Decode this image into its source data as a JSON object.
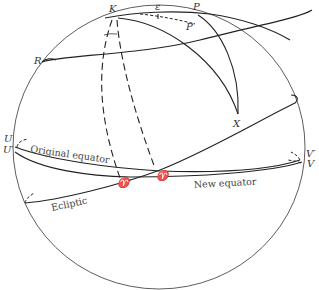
{
  "diagram": {
    "type": "celestial-sphere-precession",
    "points": {
      "K": "K",
      "P": "P",
      "P_prime": "P′",
      "epsilon": "ε",
      "R": "R",
      "X": "X",
      "U": "U",
      "U_prime": "U′",
      "V": "V",
      "V_prime": "V′",
      "vernal": "♈",
      "vernal_prime": "♈′"
    },
    "labels": {
      "original_equator": "Original equator",
      "new_equator": "New equator",
      "ecliptic": "Ecliptic"
    },
    "colors": {
      "stroke": "#222222",
      "background": "#ffffff"
    }
  }
}
